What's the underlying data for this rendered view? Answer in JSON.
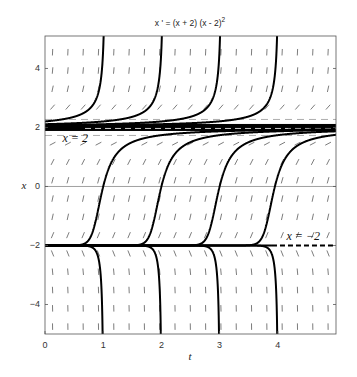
{
  "chart_data": {
    "type": "line",
    "subtype": "direction-field-with-solution-curves",
    "title": "x ' = (x + 2) (x - 2)",
    "title_superscript": "2",
    "equation": "x' = (x + 2)(x - 2)^2",
    "xlabel": "t",
    "ylabel": "x",
    "xlim": [
      0,
      5
    ],
    "ylim": [
      -5,
      5.1
    ],
    "xticks": [
      0,
      1,
      2,
      3,
      4
    ],
    "xtick_labels": [
      "0",
      "1",
      "2",
      "3",
      "4"
    ],
    "yticks": [
      -4,
      -2,
      0,
      2,
      4
    ],
    "ytick_labels": [
      "-4",
      "-2",
      "0",
      "2",
      "4"
    ],
    "grid": false,
    "reference_line": {
      "y": 0,
      "color": "#888888"
    },
    "equilibria": [
      {
        "x": 2,
        "label": "x = 2",
        "style": "heavy",
        "label_pos": {
          "t": 0.3,
          "x": 1.5
        }
      },
      {
        "x": -2,
        "label": "x = -2",
        "style": "solid-then-dashed",
        "dash_from_t": 3.9,
        "label_pos": {
          "t": 4.15,
          "x": -1.8
        }
      }
    ],
    "solution_curves": [
      {
        "region": "x>2",
        "seed_t": 0.98,
        "seed_x": 4
      },
      {
        "region": "x>2",
        "seed_t": 1.98,
        "seed_x": 4
      },
      {
        "region": "x>2",
        "seed_t": 2.98,
        "seed_x": 4
      },
      {
        "region": "x>2",
        "seed_t": 3.96,
        "seed_x": 4
      },
      {
        "region": "-2<x<2",
        "seed_t": 1.0,
        "seed_x": 0
      },
      {
        "region": "-2<x<2",
        "seed_t": 2.0,
        "seed_x": 0
      },
      {
        "region": "-2<x<2",
        "seed_t": 3.0,
        "seed_x": 0
      },
      {
        "region": "-2<x<2",
        "seed_t": 3.95,
        "seed_x": 0
      },
      {
        "region": "x<-2",
        "seed_t": 0.98,
        "seed_x": -4
      },
      {
        "region": "x<-2",
        "seed_t": 1.98,
        "seed_x": -4
      },
      {
        "region": "x<-2",
        "seed_t": 2.98,
        "seed_x": -4
      },
      {
        "region": "x<-2",
        "seed_t": 3.98,
        "seed_x": -4
      }
    ],
    "slope_field": {
      "t_step": 0.263,
      "x_step": 0.62,
      "segment_length": 0.16
    },
    "colors": {
      "curve": "#000000",
      "field": "#444444",
      "axes": "#555555",
      "background": "#ffffff"
    }
  }
}
